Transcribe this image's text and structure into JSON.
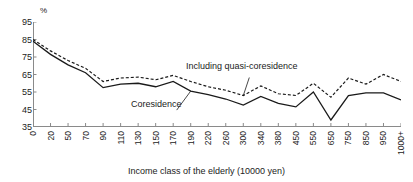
{
  "chart_data": {
    "type": "line",
    "title": "",
    "xlabel": "Income class of the elderly (10000 yen)",
    "ylabel": "%",
    "ylim": [
      35,
      95
    ],
    "yticks": [
      95,
      85,
      75,
      65,
      55,
      45,
      35
    ],
    "grid": false,
    "legend_position": "inline-annotations",
    "categories": [
      "0",
      "20",
      "50",
      "70",
      "90",
      "110",
      "130",
      "150",
      "170",
      "190",
      "220",
      "260",
      "300",
      "340",
      "380",
      "450",
      "550",
      "650",
      "750",
      "850",
      "950",
      "1000+"
    ],
    "series": [
      {
        "name": "Including quasi-coresidence",
        "style": "dashed",
        "color": "#1a1a1a",
        "values": [
          85.0,
          78.5,
          73.0,
          68.5,
          61.0,
          63.0,
          63.5,
          62.0,
          64.5,
          61.0,
          58.0,
          56.0,
          53.0,
          58.5,
          54.0,
          53.0,
          60.0,
          52.0,
          63.0,
          59.5,
          65.0,
          61.0
        ]
      },
      {
        "name": "Coresidence",
        "style": "solid",
        "color": "#1a1a1a",
        "values": [
          84.0,
          76.5,
          70.5,
          66.0,
          57.5,
          59.5,
          60.0,
          58.0,
          61.0,
          55.5,
          53.5,
          51.0,
          47.5,
          52.5,
          48.5,
          46.5,
          55.0,
          39.0,
          53.0,
          54.5,
          54.5,
          50.5
        ]
      }
    ],
    "annotations": [
      {
        "text": "Including quasi-coresidence",
        "target_series": "Including quasi-coresidence"
      },
      {
        "text": "Coresidence",
        "target_series": "Coresidence"
      }
    ]
  }
}
